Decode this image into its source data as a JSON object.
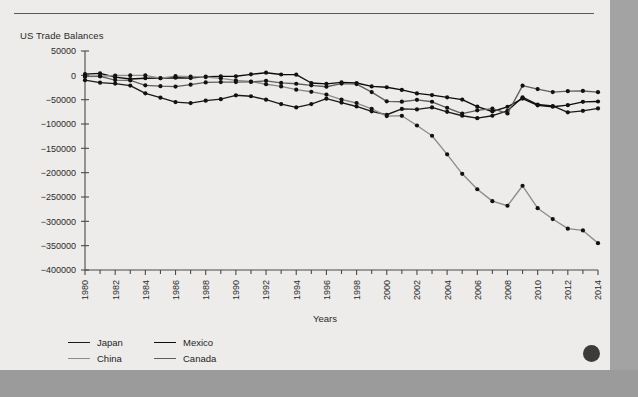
{
  "document": {
    "figure_label": "US Trade Balances",
    "page_marker": "page-dot"
  },
  "chart_data": {
    "type": "line",
    "title": "US Trade Balances",
    "xlabel": "Years",
    "ylabel": "",
    "xlim": [
      1980,
      2014
    ],
    "ylim": [
      -400000,
      50000
    ],
    "ytick_labels": [
      "50000",
      "0",
      "−500 00",
      "−100000",
      "−150000",
      "−200000",
      "−250000",
      "−300000",
      "−350000",
      "−400000"
    ],
    "yticks": [
      50000,
      0,
      -50000,
      -100000,
      -150000,
      -200000,
      -250000,
      -300000,
      -350000,
      -400000
    ],
    "xticks": [
      1980,
      1982,
      1984,
      1986,
      1988,
      1990,
      1992,
      1994,
      1996,
      1998,
      2000,
      2002,
      2004,
      2006,
      2008,
      2010,
      2012,
      2014
    ],
    "xtick_labels": [
      "1980",
      "1982",
      "1984",
      "1986",
      "1988",
      "1990",
      "1992",
      "1994",
      "1996",
      "1998",
      "2000",
      "2002",
      "2004",
      "2006",
      "2008",
      "2010",
      "2012",
      "2014"
    ],
    "xtick_rotation": 90,
    "minor_xticks_every": 1,
    "grid": false,
    "legend_position": "below-left",
    "markers": true,
    "x": [
      1980,
      1981,
      1982,
      1983,
      1984,
      1985,
      1986,
      1987,
      1988,
      1989,
      1990,
      1991,
      1992,
      1993,
      1994,
      1995,
      1996,
      1997,
      1998,
      1999,
      2000,
      2001,
      2002,
      2003,
      2004,
      2005,
      2006,
      2007,
      2008,
      2009,
      2010,
      2011,
      2012,
      2013,
      2014
    ],
    "series": [
      {
        "name": "Japan",
        "color": "#1b1b1b",
        "values": [
          -10000,
          -15000,
          -17000,
          -21000,
          -37000,
          -46000,
          -55000,
          -57000,
          -52000,
          -49000,
          -41000,
          -43000,
          -50000,
          -59000,
          -66000,
          -59000,
          -48000,
          -56000,
          -64000,
          -74000,
          -81000,
          -69000,
          -70000,
          -66000,
          -75000,
          -83000,
          -88000,
          -83000,
          -73000,
          -45000,
          -60000,
          -63000,
          -76000,
          -73000,
          -68000
        ]
      },
      {
        "name": "Mexico",
        "color": "#0d0d0d",
        "values": [
          2500,
          4000,
          -3800,
          -7600,
          -6000,
          -5800,
          -4900,
          -5700,
          -2600,
          -2200,
          -1900,
          2100,
          5400,
          1700,
          1350,
          -15800,
          -17500,
          -14500,
          -15800,
          -22800,
          -24500,
          -30000,
          -37100,
          -40600,
          -45200,
          -49900,
          -64500,
          -74300,
          -64600,
          -47700,
          -61600,
          -64500,
          -61300,
          -54500,
          -53800
        ]
      },
      {
        "name": "China",
        "color": "#8c8c8c",
        "values": [
          -2700,
          -1800,
          -300,
          -100,
          -100,
          -6000,
          -1700,
          -2800,
          -3500,
          -6200,
          -10400,
          -12700,
          -18300,
          -22800,
          -29500,
          -33800,
          -39500,
          -49700,
          -56900,
          -68700,
          -83800,
          -83100,
          -103100,
          -124100,
          -162300,
          -202300,
          -234100,
          -258500,
          -268000,
          -226900,
          -273000,
          -295300,
          -315100,
          -318700,
          -344800
        ]
      },
      {
        "name": "Canada",
        "color": "#5f5f5f",
        "values": [
          -1500,
          -2000,
          -9800,
          -10500,
          -20500,
          -22200,
          -23200,
          -19200,
          -14500,
          -13900,
          -13900,
          -13600,
          -11300,
          -15600,
          -17300,
          -20500,
          -23500,
          -17000,
          -18000,
          -34500,
          -53500,
          -54200,
          -50300,
          -54300,
          -66800,
          -78500,
          -72000,
          -68500,
          -78300,
          -21200,
          -28300,
          -34400,
          -32500,
          -32100,
          -34600
        ]
      }
    ]
  },
  "legend": {
    "rows": [
      [
        {
          "label": "Japan",
          "color": "#1b1b1b"
        },
        {
          "label": "Mexico",
          "color": "#0d0d0d"
        }
      ],
      [
        {
          "label": "China",
          "color": "#8c8c8c"
        },
        {
          "label": "Canada",
          "color": "#5f5f5f"
        }
      ]
    ]
  }
}
